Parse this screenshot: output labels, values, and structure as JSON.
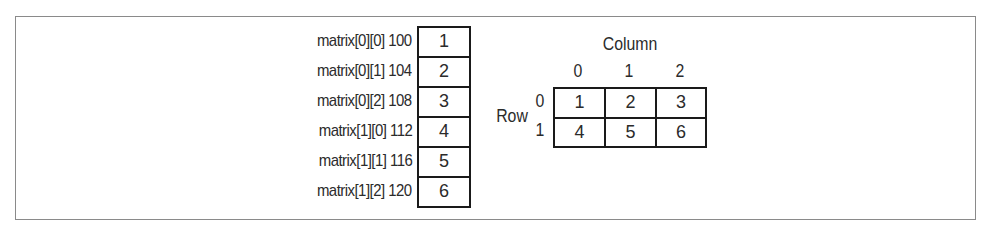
{
  "memory_layout": {
    "entries": [
      {
        "label": "matrix[0][0] 100",
        "value": "1"
      },
      {
        "label": "matrix[0][1] 104",
        "value": "2"
      },
      {
        "label": "matrix[0][2] 108",
        "value": "3"
      },
      {
        "label": "matrix[1][0] 112",
        "value": "4"
      },
      {
        "label": "matrix[1][1] 116",
        "value": "5"
      },
      {
        "label": "matrix[1][2] 120",
        "value": "6"
      }
    ]
  },
  "grid": {
    "column_title": "Column",
    "row_title": "Row",
    "column_indices": [
      "0",
      "1",
      "2"
    ],
    "row_indices": [
      "0",
      "1"
    ],
    "cells": [
      [
        "1",
        "2",
        "3"
      ],
      [
        "4",
        "5",
        "6"
      ]
    ]
  },
  "colors": {
    "border": "#1a1a1a",
    "frame": "#8a8a8a",
    "text": "#2b2b2b"
  }
}
